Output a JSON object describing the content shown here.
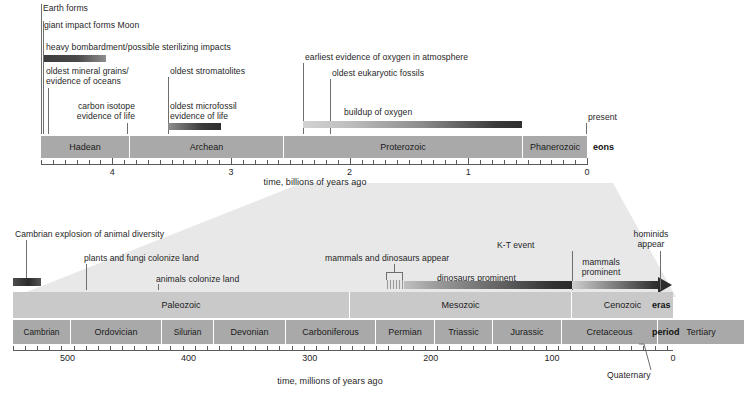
{
  "figure": {
    "type": "timeline-diagram"
  },
  "chart_data": {
    "type": "table",
    "panels": [
      {
        "name": "upper",
        "xlabel": "time, billions of years ago",
        "xlim": [
          4.6,
          0
        ],
        "units": "billions of years ago",
        "ticks_major": [
          "4",
          "3",
          "2",
          "1",
          "0"
        ],
        "row_label": "eons",
        "blocks": [
          {
            "label": "Hadean",
            "start": 4.55,
            "end": 3.8
          },
          {
            "label": "Archean",
            "start": 3.8,
            "end": 2.5
          },
          {
            "label": "Proterozoic",
            "start": 2.5,
            "end": 0.541
          },
          {
            "label": "Phanerozoic",
            "start": 0.541,
            "end": 0
          }
        ],
        "events": [
          {
            "label": "Earth forms",
            "time": 4.55,
            "kind": "line"
          },
          {
            "label": "giant impact forms Moon",
            "time": 4.5,
            "kind": "line"
          },
          {
            "label": "heavy bombardment/possible sterilizing impacts",
            "start": 4.5,
            "end": 3.85,
            "kind": "bar"
          },
          {
            "label": "oldest mineral grains/\nevidence of oceans",
            "time": 4.4,
            "kind": "line"
          },
          {
            "label": "carbon isotope\nevidence of life",
            "time": 3.85,
            "kind": "line"
          },
          {
            "label": "oldest stromatolites",
            "time": 3.5,
            "kind": "line"
          },
          {
            "label": "oldest microfossil\nevidence of life",
            "start": 3.5,
            "end": 3.2,
            "kind": "bar"
          },
          {
            "label": "earliest evidence of oxygen in atmosphere",
            "time": 2.45,
            "kind": "line"
          },
          {
            "label": "oldest eukaryotic fossils",
            "time": 2.1,
            "kind": "line"
          },
          {
            "label": "buildup of oxygen",
            "start": 2.45,
            "end": 0.6,
            "kind": "bar"
          },
          {
            "label": "present",
            "time": 0,
            "kind": "line"
          }
        ]
      },
      {
        "name": "lower",
        "xlabel": "time, millions of years ago",
        "xlim": [
          545,
          0
        ],
        "units": "millions of years ago",
        "ticks_major": [
          "500",
          "400",
          "300",
          "200",
          "100",
          "0"
        ],
        "row_label_eras": "eras",
        "row_label_periods": "period",
        "eras": [
          {
            "label": "Paleozoic",
            "start": 541,
            "end": 252
          },
          {
            "label": "Mesozoic",
            "start": 252,
            "end": 66
          },
          {
            "label": "Cenozoic",
            "start": 66,
            "end": 0
          }
        ],
        "periods": [
          {
            "label": "Cambrian",
            "start": 541,
            "end": 485
          },
          {
            "label": "Ordovician",
            "start": 485,
            "end": 444
          },
          {
            "label": "Silurian",
            "start": 444,
            "end": 419
          },
          {
            "label": "Devonian",
            "start": 419,
            "end": 359
          },
          {
            "label": "Carboniferous",
            "start": 359,
            "end": 299
          },
          {
            "label": "Permian",
            "start": 299,
            "end": 252
          },
          {
            "label": "Triassic",
            "start": 252,
            "end": 201
          },
          {
            "label": "Jurassic",
            "start": 201,
            "end": 145
          },
          {
            "label": "Cretaceous",
            "start": 145,
            "end": 66
          },
          {
            "label": "Tertiary",
            "start": 66,
            "end": 2.6
          },
          {
            "label": "Quaternary",
            "start": 2.6,
            "end": 0
          }
        ],
        "events": [
          {
            "label": "Cambrian explosion of animal diversity",
            "time": 535,
            "kind": "block"
          },
          {
            "label": "plants and fungi colonize land",
            "time": 470,
            "kind": "line"
          },
          {
            "label": "animals colonize land",
            "time": 420,
            "kind": "line"
          },
          {
            "label": "mammals and dinosaurs appear",
            "time": 230,
            "kind": "bracket"
          },
          {
            "label": "dinosaurs prominent",
            "start": 230,
            "end": 66,
            "kind": "bar"
          },
          {
            "label": "K-T event",
            "time": 66,
            "kind": "line"
          },
          {
            "label": "mammals prominent",
            "start": 66,
            "end": 0,
            "kind": "bar"
          },
          {
            "label": "hominids appear",
            "time": 6,
            "kind": "line"
          }
        ]
      }
    ]
  },
  "upper": {
    "axis_label": "time, billions of years ago",
    "row_tag": "eons",
    "ticks": [
      {
        "text": "4"
      },
      {
        "text": "3"
      },
      {
        "text": "2"
      },
      {
        "text": "1"
      },
      {
        "text": "0"
      }
    ],
    "eons": [
      {
        "label": "Hadean"
      },
      {
        "label": "Archean"
      },
      {
        "label": "Proterozoic"
      },
      {
        "label": "Phanerozoic"
      }
    ],
    "events": {
      "earth_forms": "Earth forms",
      "giant_impact": "giant impact forms Moon",
      "heavy_bombardment": "heavy bombardment/possible sterilizing impacts",
      "oldest_mineral_1": "oldest mineral grains/",
      "oldest_mineral_2": "evidence of oceans",
      "carbon_isotope_1": "carbon isotope",
      "carbon_isotope_2": "evidence of life",
      "oldest_stromatolites": "oldest stromatolites",
      "oldest_microfossil_1": "oldest microfossil",
      "oldest_microfossil_2": "evidence of life",
      "earliest_oxygen": "earliest evidence of oxygen in atmosphere",
      "oldest_eukaryotic": "oldest eukaryotic fossils",
      "buildup_oxygen": "buildup of oxygen",
      "present": "present"
    }
  },
  "lower": {
    "axis_label": "time, millions of years ago",
    "row_tag_eras": "eras",
    "row_tag_periods": "period",
    "ticks": [
      {
        "text": "500"
      },
      {
        "text": "400"
      },
      {
        "text": "300"
      },
      {
        "text": "200"
      },
      {
        "text": "100"
      },
      {
        "text": "0"
      }
    ],
    "quaternary": "Quaternary",
    "eras": [
      {
        "label": "Paleozoic"
      },
      {
        "label": "Mesozoic"
      },
      {
        "label": "Cenozoic"
      }
    ],
    "periods": [
      {
        "label": "Cambrian"
      },
      {
        "label": "Ordovician"
      },
      {
        "label": "Silurian"
      },
      {
        "label": "Devonian"
      },
      {
        "label": "Carboniferous"
      },
      {
        "label": "Permian"
      },
      {
        "label": "Triassic"
      },
      {
        "label": "Jurassic"
      },
      {
        "label": "Cretaceous"
      },
      {
        "label": "Tertiary"
      }
    ],
    "events": {
      "cambrian_explosion": "Cambrian explosion of animal diversity",
      "plants_fungi": "plants and fungi colonize land",
      "animals_land": "animals colonize land",
      "mammals_dinos_appear": "mammals and dinosaurs appear",
      "dinosaurs_prominent": "dinosaurs prominent",
      "kt_event": "K-T event",
      "mammals_prominent_1": "mammals",
      "mammals_prominent_2": "prominent",
      "hominids_1": "hominids",
      "hominids_2": "appear"
    }
  },
  "colors": {
    "block_fill": "#a9a9a9",
    "era_fill": "#c9c9c9",
    "funnel_fill": "#e6e6e6",
    "line": "#6e6e6e",
    "bar_dark": "#3b3b3b",
    "bar_light": "#c4c4c4"
  }
}
